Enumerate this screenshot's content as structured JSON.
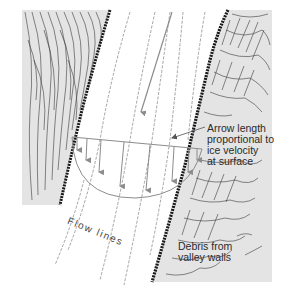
{
  "diagram": {
    "labels": {
      "arrow_note": [
        "Arrow length",
        "proportional to",
        "ice velocity",
        "at surface"
      ],
      "flow_lines": "Flow lines",
      "debris": [
        "Debris from",
        "valley walls"
      ]
    },
    "colors": {
      "background": "#ffffff",
      "valley_wall_fill": "#e4e4e4",
      "hatch": "#2b2b2b",
      "flow_line": "#9a9a9a",
      "arrow": "#8c8c8c",
      "text": "#2a2a2a"
    },
    "elements": [
      "left-valley-wall",
      "right-valley-wall",
      "flow-lines",
      "velocity-profile-semicircle",
      "velocity-arrows",
      "main-flow-arrow"
    ]
  }
}
